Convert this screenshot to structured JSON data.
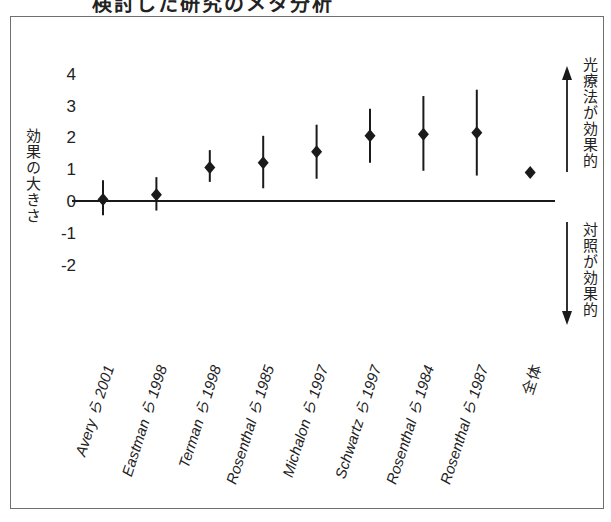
{
  "title": "検討した研究のメタ分析",
  "y_axis": {
    "label": "効果の大きさ",
    "ticks": [
      "4",
      "3",
      "2",
      "1",
      "0",
      "-1",
      "-2"
    ]
  },
  "annotations": {
    "up": "光療法が効果的",
    "down": "対照が効果的"
  },
  "x_axis": {
    "labels": [
      "Avery ら 2001",
      "Eastman ら 1998",
      "Terman ら 1998",
      "Rosenthal ら 1985",
      "Michalon ら 1997",
      "Schwartz ら 1997",
      "Rosenthal ら 1984",
      "Rosenthal ら 1987",
      "全体"
    ]
  },
  "colors": {
    "ink": "#1a1a1a",
    "frame": "#6f6f6f",
    "background": "#ffffff"
  },
  "chart_data": {
    "type": "scatter",
    "subtype": "forest-plot",
    "title": "検討した研究のメタ分析",
    "xlabel": "",
    "ylabel": "効果の大きさ",
    "ylim": [
      -2,
      4
    ],
    "yticks": [
      4,
      3,
      2,
      1,
      0,
      -1,
      -2
    ],
    "grid": false,
    "reference_line": 0,
    "categories": [
      "Avery ら 2001",
      "Eastman ら 1998",
      "Terman ら 1998",
      "Rosenthal ら 1985",
      "Michalon ら 1997",
      "Schwartz ら 1997",
      "Rosenthal ら 1984",
      "Rosenthal ら 1987",
      "全体"
    ],
    "series": [
      {
        "name": "効果の大きさ",
        "values": [
          0.05,
          0.2,
          1.05,
          1.2,
          1.55,
          2.05,
          2.1,
          2.15,
          0.9
        ],
        "lower": [
          -0.45,
          -0.3,
          0.6,
          0.4,
          0.7,
          1.2,
          0.95,
          0.8,
          null
        ],
        "upper": [
          0.65,
          0.75,
          1.6,
          2.05,
          2.4,
          2.9,
          3.3,
          3.5,
          null
        ]
      }
    ],
    "annotations": [
      {
        "text": "光療法が効果的",
        "direction": "up"
      },
      {
        "text": "対照が効果的",
        "direction": "down"
      }
    ]
  }
}
